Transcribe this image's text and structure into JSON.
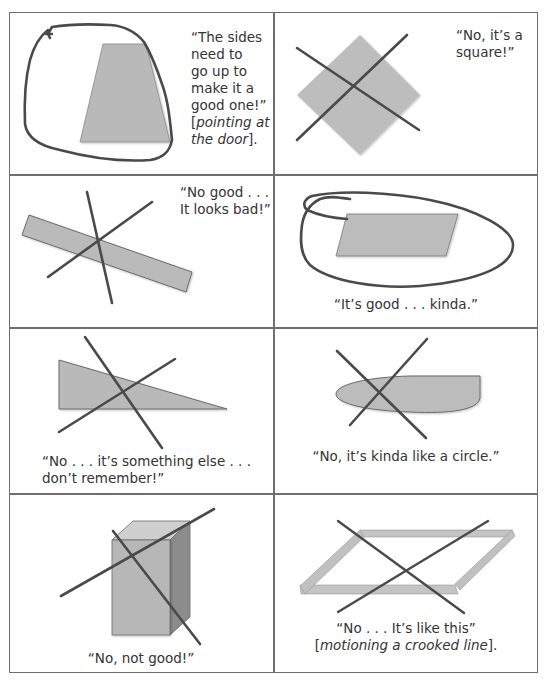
{
  "figure": {
    "layout": {
      "rows": 4,
      "columns": 2
    },
    "colors": {
      "border": "#6e6e6e",
      "shape_fill": "#b9b9b9",
      "shape_fill_dark": "#9a9a9a",
      "stroke": "#4a4a4a",
      "text": "#333333"
    },
    "cells": [
      {
        "id": "cell-1",
        "shape": "trapezoid",
        "marking": "circled",
        "quote_lines": [
          "“The sides",
          "need to",
          "go up to",
          "make it a",
          "good one!”"
        ],
        "action_prefix": "[",
        "action_italic_1": "pointing at",
        "action_italic_2": "the door",
        "action_suffix": "]."
      },
      {
        "id": "cell-2",
        "shape": "square-rotated",
        "marking": "crossed-out",
        "quote_lines": [
          "“No, it’s a",
          "square!”"
        ]
      },
      {
        "id": "cell-3",
        "shape": "thin-rectangle-tilted",
        "marking": "crossed-out",
        "quote_lines": [
          "“No good . . .",
          "It looks bad!”"
        ]
      },
      {
        "id": "cell-4",
        "shape": "parallelogram",
        "marking": "circled",
        "quote_lines": [
          "“It’s good . . . kinda.”"
        ]
      },
      {
        "id": "cell-5",
        "shape": "right-triangle",
        "marking": "crossed-out",
        "quote_lines": [
          "“No . . . it’s something else . . .",
          "don’t remember!”"
        ]
      },
      {
        "id": "cell-6",
        "shape": "half-ellipse",
        "marking": "crossed-out",
        "quote_lines": [
          "“No, it’s kinda like a circle.”"
        ]
      },
      {
        "id": "cell-7",
        "shape": "rectangular-prism",
        "marking": "crossed-out",
        "quote_lines": [
          "“No, not good!”"
        ]
      },
      {
        "id": "cell-8",
        "shape": "parallelogram-frame",
        "marking": "crossed-out",
        "quote_lines": [
          "“No . . . It’s like this”"
        ],
        "action_prefix": "[",
        "action_italic_1": "motioning a crooked line",
        "action_suffix": "]."
      }
    ]
  }
}
